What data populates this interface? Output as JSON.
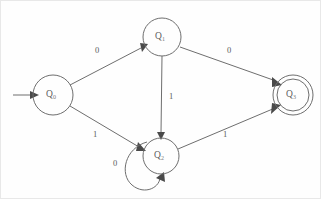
{
  "diagram": {
    "kind": "finite-state-machine",
    "alphabet": [
      "0",
      "1"
    ],
    "colors": {
      "background": "#fefefe",
      "stroke": "#6e6e6e",
      "arrow": "#4a4a4a",
      "label": "#5a5a5a"
    },
    "states": [
      {
        "id": "q0",
        "name": "Q",
        "subscript": "0",
        "cx": 52,
        "cy": 94,
        "r": 20,
        "accepting": false,
        "start": true
      },
      {
        "id": "q1",
        "name": "Q",
        "subscript": "1",
        "cx": 161,
        "cy": 36,
        "r": 19,
        "accepting": false,
        "start": false
      },
      {
        "id": "q2",
        "name": "Q",
        "subscript": "2",
        "cx": 160,
        "cy": 155,
        "r": 18,
        "accepting": false,
        "start": false
      },
      {
        "id": "q3",
        "name": "Q",
        "subscript": "3",
        "cx": 292,
        "cy": 94,
        "r": 20,
        "inner_r": 16,
        "accepting": true,
        "start": false
      }
    ],
    "start_arrow": {
      "label": "start-arrow",
      "x1": 12,
      "y1": 94,
      "x2": 31,
      "y2": 94
    },
    "transitions": [
      {
        "id": "t-q0-q1",
        "from": "q0",
        "to": "q1",
        "symbol": "0",
        "label_x": 96,
        "label_y": 50,
        "x1": 69,
        "y1": 83,
        "x2": 144,
        "y2": 44
      },
      {
        "id": "t-q0-q2",
        "from": "q0",
        "to": "q2",
        "symbol": "1",
        "label_x": 94,
        "label_y": 134,
        "x1": 69,
        "y1": 105,
        "x2": 142,
        "y2": 148
      },
      {
        "id": "t-q1-q2",
        "from": "q1",
        "to": "q2",
        "symbol": "1",
        "label_x": 170,
        "label_y": 96,
        "x1": 161,
        "y1": 55,
        "x2": 160,
        "y2": 136
      },
      {
        "id": "t-q1-q3",
        "from": "q1",
        "to": "q3",
        "symbol": "0",
        "label_x": 228,
        "label_y": 50,
        "x1": 178,
        "y1": 44,
        "x2": 277,
        "y2": 83
      },
      {
        "id": "t-q2-q3",
        "from": "q2",
        "to": "q3",
        "symbol": "1",
        "label_x": 224,
        "label_y": 134,
        "x1": 177,
        "y1": 148,
        "x2": 277,
        "y2": 105
      },
      {
        "id": "t-q2-q2",
        "from": "q2",
        "to": "q2",
        "symbol": "0",
        "self_loop": true,
        "label_x": 114,
        "label_y": 163,
        "loop_cx": 140,
        "loop_cy": 173,
        "loop_r": 19
      }
    ]
  }
}
